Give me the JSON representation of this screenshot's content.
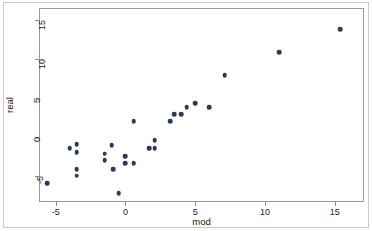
{
  "chart_data": {
    "type": "scatter",
    "title": "",
    "xlabel": "mod",
    "ylabel": "real",
    "xlim": [
      -6.2,
      17.1
    ],
    "ylim": [
      -8.4,
      16.5
    ],
    "xticks": [
      -5,
      0,
      5,
      10,
      15
    ],
    "xtick_labels": [
      "-5",
      "0",
      "5",
      "10",
      "15"
    ],
    "yticks": [
      -5,
      0,
      5,
      10,
      15
    ],
    "ytick_labels": [
      "-5",
      "0",
      "5",
      "10",
      "15"
    ],
    "grid": false,
    "legend": null,
    "marker": {
      "shape": "circle",
      "color": "#2b3a55",
      "size": 4.6
    },
    "points": [
      {
        "x": -5.6,
        "y": -6.0
      },
      {
        "x": -4.0,
        "y": -1.5
      },
      {
        "x": -3.5,
        "y": -1.0
      },
      {
        "x": -3.5,
        "y": -2.0
      },
      {
        "x": -3.5,
        "y": -4.2
      },
      {
        "x": -3.5,
        "y": -5.0
      },
      {
        "x": -1.5,
        "y": -2.2
      },
      {
        "x": -1.5,
        "y": -3.0
      },
      {
        "x": -1.0,
        "y": -1.1
      },
      {
        "x": -0.9,
        "y": -4.2
      },
      {
        "x": -0.5,
        "y": -7.3
      },
      {
        "x": 0.0,
        "y": -2.5
      },
      {
        "x": 0.0,
        "y": -3.4
      },
      {
        "x": 0.6,
        "y": -3.4
      },
      {
        "x": 0.6,
        "y": 2.0
      },
      {
        "x": 1.7,
        "y": -1.5
      },
      {
        "x": 2.1,
        "y": -0.5
      },
      {
        "x": 2.1,
        "y": -1.5
      },
      {
        "x": 3.2,
        "y": 2.0
      },
      {
        "x": 3.5,
        "y": 2.9
      },
      {
        "x": 4.0,
        "y": 2.9
      },
      {
        "x": 4.4,
        "y": 3.8
      },
      {
        "x": 5.0,
        "y": 4.3
      },
      {
        "x": 6.0,
        "y": 3.8
      },
      {
        "x": 7.1,
        "y": 7.9
      },
      {
        "x": 11.0,
        "y": 10.8
      },
      {
        "x": 15.4,
        "y": 13.8
      }
    ]
  },
  "axes": {
    "x_title": "mod",
    "y_title": "real"
  }
}
